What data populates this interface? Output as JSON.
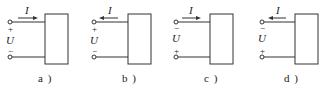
{
  "figure": {
    "panels": [
      {
        "id": "a",
        "caption": "a )",
        "current_label": "I",
        "voltage_label": "U",
        "top_sign": "+",
        "bottom_sign": "−",
        "arrow_direction": "right"
      },
      {
        "id": "b",
        "caption": "b )",
        "current_label": "I",
        "voltage_label": "U",
        "top_sign": "+",
        "bottom_sign": "−",
        "arrow_direction": "left"
      },
      {
        "id": "c",
        "caption": "c )",
        "current_label": "I",
        "voltage_label": "U",
        "top_sign": "−",
        "bottom_sign": "+",
        "arrow_direction": "right"
      },
      {
        "id": "d",
        "caption": "d )",
        "current_label": "I",
        "voltage_label": "U",
        "top_sign": "−",
        "bottom_sign": "+",
        "arrow_direction": "left"
      }
    ],
    "colors": {
      "line": "#333333",
      "background": "#ffffff"
    }
  }
}
